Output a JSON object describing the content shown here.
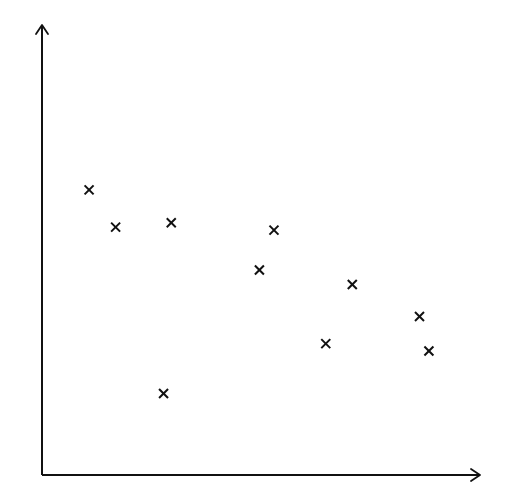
{
  "chart_data": {
    "type": "scatter",
    "title": "",
    "xlabel": "",
    "ylabel": "",
    "grid": false,
    "legend": null,
    "marker": "x",
    "marker_color": "#111111",
    "axis_color": "#111111",
    "background": "#ffffff",
    "xlim": [
      0,
      100
    ],
    "ylim": [
      0,
      100
    ],
    "points": [
      {
        "x": 11.0,
        "y": 65.1
      },
      {
        "x": 17.2,
        "y": 56.6
      },
      {
        "x": 30.2,
        "y": 57.6
      },
      {
        "x": 28.4,
        "y": 18.6
      },
      {
        "x": 50.8,
        "y": 46.8
      },
      {
        "x": 54.2,
        "y": 55.9
      },
      {
        "x": 66.3,
        "y": 30.0
      },
      {
        "x": 72.5,
        "y": 43.5
      },
      {
        "x": 88.2,
        "y": 36.2
      },
      {
        "x": 90.4,
        "y": 28.3
      }
    ]
  }
}
